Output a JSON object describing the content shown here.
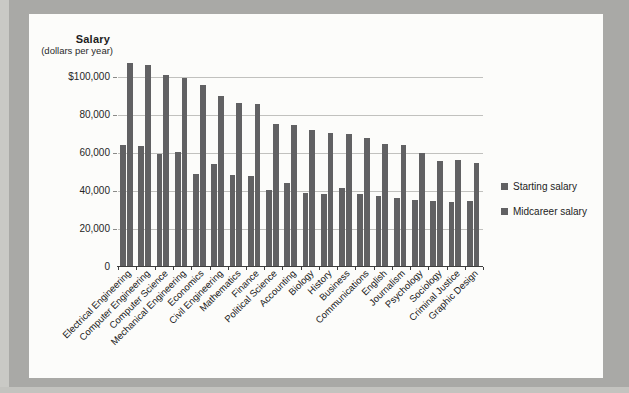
{
  "figure": {
    "title": "Salary",
    "subtitle": "(dollars per year)"
  },
  "colors": {
    "photo_background": "#a9a9a6",
    "photo_edge_left": "#c9c9c5",
    "photo_edge_bottom": "#c3c3bf",
    "card_background": "#fcfcfa",
    "bar": "#616163",
    "gridline": "#c1c1be",
    "axis": "#3d3d3d",
    "tick": "#8a8a88"
  },
  "chart_data": {
    "type": "bar",
    "title": "Salary",
    "subtitle": "(dollars per year)",
    "ylabel": "Salary (dollars per year)",
    "xlabel": "",
    "ylim": [
      0,
      107000
    ],
    "grid": "horizontal gridlines every 20,000",
    "legend_position": "right of plot area",
    "ytick_values": [
      0,
      20000,
      40000,
      60000,
      80000,
      100000
    ],
    "ytick_labels": [
      "0",
      "20,000",
      "40,000",
      "60,000",
      "80,000",
      "$100,000"
    ],
    "categories": [
      "Electrical Engineering",
      "Computer Engineering",
      "Computer Science",
      "Mechanical Engineering",
      "Economics",
      "Civil Engineering",
      "Mathematics",
      "Finance",
      "Political Science",
      "Accounting",
      "Biology",
      "History",
      "Business",
      "Communications",
      "English",
      "Journalism",
      "Psychology",
      "Sociology",
      "Criminal Justice",
      "Graphic Design"
    ],
    "series": [
      {
        "name": "Starting salary",
        "color": "#616163",
        "values": [
          63500,
          63000,
          58500,
          60000,
          48000,
          53500,
          47500,
          47000,
          40000,
          43500,
          38000,
          37500,
          41000,
          37500,
          36500,
          35500,
          34500,
          34000,
          33500,
          34000
        ]
      },
      {
        "name": "Midcareer salary",
        "color": "#616163",
        "values": [
          106500,
          105500,
          100500,
          98500,
          95000,
          89000,
          85500,
          85000,
          74500,
          74000,
          71500,
          69500,
          69000,
          67000,
          64000,
          63500,
          59000,
          55000,
          55500,
          54000
        ]
      }
    ]
  }
}
